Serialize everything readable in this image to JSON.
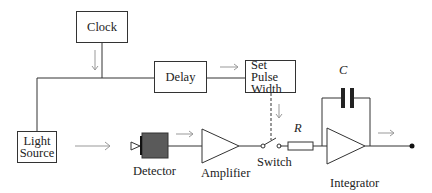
{
  "diagram": {
    "blocks": {
      "clock": "Clock",
      "delay": "Delay",
      "set_pulse_width": "Set Pulse Width",
      "light_source": "Light Source"
    },
    "components": {
      "detector": "Detector",
      "amplifier": "Amplifier",
      "switch": "Switch",
      "integrator": "Integrator",
      "resistor": "R",
      "capacitor": "C"
    },
    "colors": {
      "line": "#333333",
      "signal_arrow": "#999999",
      "detector_fill": "#5a5a5a"
    }
  }
}
